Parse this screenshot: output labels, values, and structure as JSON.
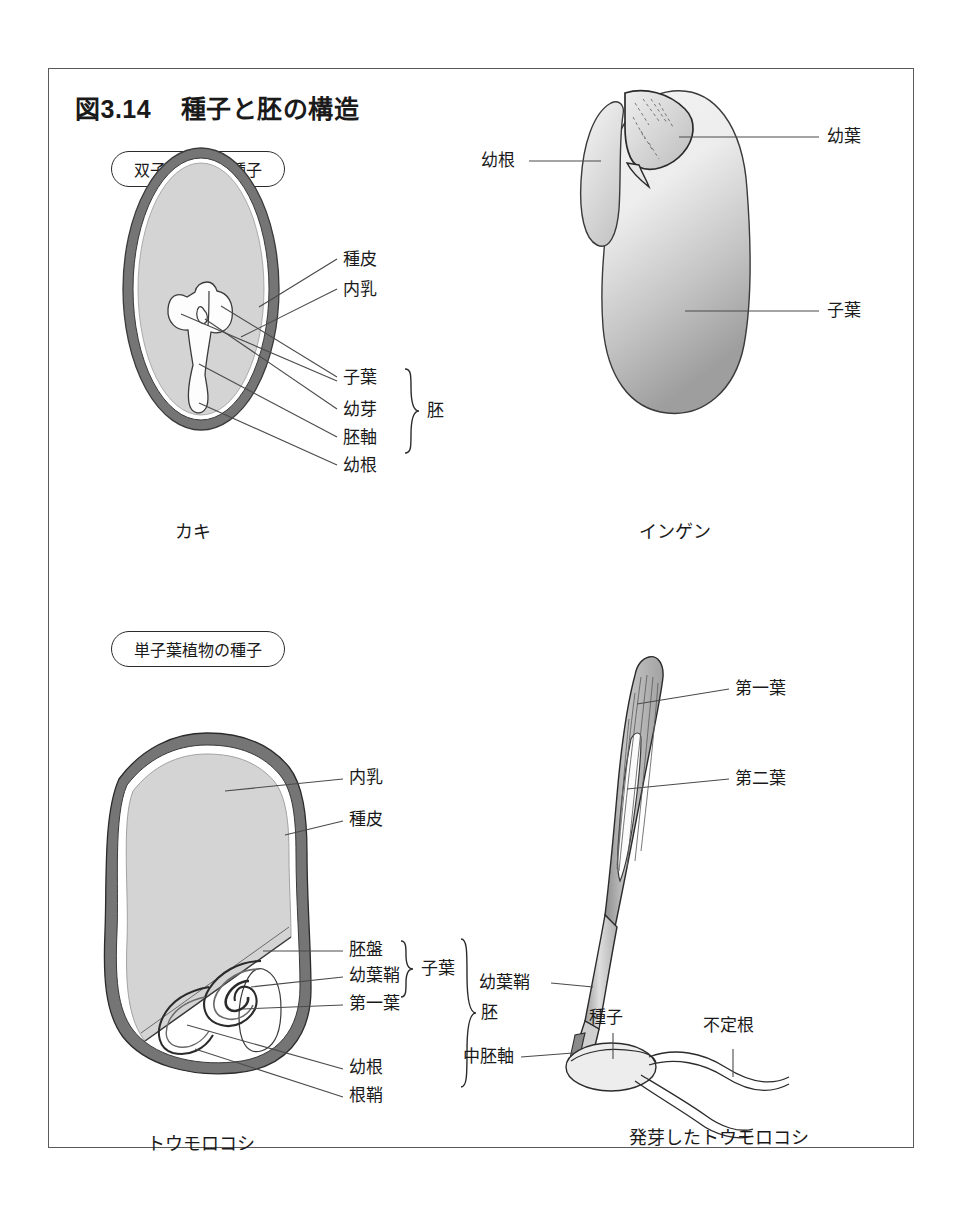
{
  "figure": {
    "number": "図3.14",
    "title": "種子と胚の構造"
  },
  "sections": {
    "dicot_pill": "双子葉植物の種子",
    "monocot_pill": "単子葉植物の種子"
  },
  "panels": {
    "persimmon": {
      "caption": "カキ",
      "labels": {
        "seed_coat": "種皮",
        "endosperm": "内乳",
        "cotyledon": "子葉",
        "plumule": "幼芽",
        "hypocotyl": "胚軸",
        "radicle": "幼根",
        "embryo_brace": "胚"
      }
    },
    "bean": {
      "caption": "インゲン",
      "labels": {
        "radicle": "幼根",
        "young_leaf": "幼葉",
        "cotyledon": "子葉"
      }
    },
    "corn_kernel": {
      "caption": "トウモロコシ",
      "labels": {
        "endosperm": "内乳",
        "seed_coat": "種皮",
        "scutellum": "胚盤",
        "coleoptile": "幼葉鞘",
        "first_leaf": "第一葉",
        "radicle": "幼根",
        "coleorhiza": "根鞘",
        "cotyledon_brace": "子葉",
        "embryo_brace": "胚"
      }
    },
    "corn_seedling": {
      "caption": "発芽したトウモロコシ",
      "labels": {
        "first_leaf": "第一葉",
        "second_leaf": "第二葉",
        "coleoptile": "幼葉鞘",
        "seed": "種子",
        "mesocotyl": "中胚軸",
        "adventitious_root": "不定根"
      }
    }
  },
  "colors": {
    "frame": "#5a5a5a",
    "seed_coat": "#757575",
    "endosperm": "#d4d4d4",
    "embryo_fill": "#fdfdfd",
    "outline": "#3a3a3a",
    "leader": "#4a4a4a",
    "bean_light": "#f2f2f2",
    "bean_dark": "#9a9a9a",
    "leaf_mid": "#b9b9b9",
    "text": "#1a1a1a"
  }
}
